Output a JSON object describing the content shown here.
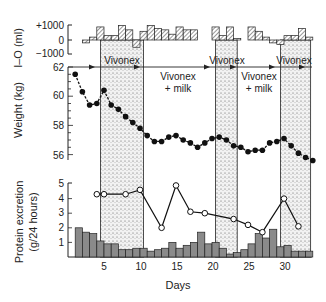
{
  "chart_data": [
    {
      "type": "bar",
      "panel": "intake-output",
      "ylabel": "I–O (ml)",
      "yticks": [
        "+1000",
        "0",
        "−1000"
      ],
      "ylim": [
        -1000,
        1000
      ],
      "x": [
        1,
        2,
        3,
        4,
        5,
        6,
        7,
        8,
        9,
        10,
        11,
        12,
        13,
        14,
        15,
        16,
        17,
        18,
        19,
        20,
        21,
        22,
        23,
        24,
        25,
        26,
        27,
        28,
        29,
        30,
        31,
        32,
        33
      ],
      "values": [
        0,
        -200,
        200,
        900,
        300,
        300,
        1000,
        700,
        -500,
        600,
        1000,
        800,
        700,
        400,
        900,
        700,
        700,
        0,
        0,
        900,
        300,
        900,
        100,
        0,
        900,
        600,
        200,
        -200,
        -300,
        300,
        300,
        800,
        200
      ]
    },
    {
      "type": "line",
      "panel": "weight",
      "ylabel": "Weight (kg)",
      "yticks": [
        62,
        60,
        58,
        56
      ],
      "ylim": [
        55.5,
        62.2
      ],
      "x": [
        1,
        2,
        3,
        4,
        5,
        6,
        7,
        8,
        9,
        10,
        11,
        12,
        13,
        14,
        15,
        16,
        17,
        18,
        19,
        20,
        21,
        22,
        23,
        24,
        25,
        26,
        27,
        28,
        29,
        30,
        31,
        32,
        33,
        34
      ],
      "values": [
        61.5,
        60.3,
        59.4,
        59.5,
        60.4,
        59.4,
        59.1,
        58.6,
        58.2,
        57.8,
        57.3,
        56.9,
        56.9,
        57.2,
        57.3,
        57.0,
        56.8,
        56.5,
        56.8,
        57.1,
        57.2,
        57.0,
        56.6,
        56.5,
        56.2,
        56.3,
        56.3,
        56.8,
        56.9,
        57.1,
        56.6,
        56.1,
        55.8,
        55.6
      ]
    },
    {
      "type": "line",
      "panel": "protein-excretion",
      "ylabel": "Protein excretion (g/24 hours)",
      "yticks": [
        5,
        4,
        3,
        2,
        1
      ],
      "ylim": [
        0,
        5
      ],
      "series": [
        {
          "name": "protein (open circles)",
          "x": [
            4,
            5,
            8,
            10,
            13,
            15,
            17,
            19,
            23,
            25,
            27,
            30,
            32
          ],
          "values": [
            4.3,
            4.3,
            4.3,
            4.6,
            2.0,
            4.9,
            3.1,
            3.0,
            2.6,
            2.2,
            1.7,
            4.0,
            2.1
          ]
        },
        {
          "name": "daily bars",
          "x": [
            2,
            3,
            4,
            5,
            6,
            7,
            8,
            9,
            10,
            11,
            12,
            13,
            14,
            15,
            16,
            17,
            18,
            19,
            20,
            21,
            22,
            23,
            24,
            25,
            26,
            27,
            28,
            29,
            30,
            31,
            32,
            33,
            34
          ],
          "values": [
            2.0,
            1.7,
            1.6,
            1.1,
            0.9,
            0.9,
            0.5,
            0.5,
            0.6,
            0.6,
            0.4,
            0.5,
            0.6,
            1.0,
            0.6,
            0.8,
            1.0,
            1.7,
            0.9,
            1.0,
            0.6,
            0.2,
            0.3,
            0.5,
            0.9,
            1.6,
            1.3,
            1.9,
            0.7,
            0.8,
            0.4,
            0.4,
            0.4
          ]
        }
      ]
    }
  ],
  "xaxis": {
    "label": "Days",
    "ticks": [
      5,
      10,
      15,
      20,
      25,
      30
    ]
  },
  "phases": [
    {
      "label": "Vivonex",
      "start": 4.5,
      "end": 10.5,
      "shaded": true
    },
    {
      "label": "Vivonex",
      "label2": "+ milk",
      "start": 10.5,
      "end": 20.5,
      "shaded": false
    },
    {
      "label": "Vivonex",
      "start": 20.5,
      "end": 23.5,
      "shaded": true
    },
    {
      "label": "Vivonex",
      "label2": "+ milk",
      "start": 23.5,
      "end": 29.5,
      "shaded": false
    },
    {
      "label": "Vivonex",
      "start": 29.5,
      "end": 33.7,
      "shaded": true
    }
  ],
  "labels": {
    "io_axis": "I–O (ml)",
    "io_plus": "+1000",
    "io_zero": "0",
    "io_minus": "−1000",
    "weight_axis": "Weight (kg)",
    "w62": "62",
    "w60": "60",
    "w58": "58",
    "w56": "56",
    "protein_axis1": "Protein excretion",
    "protein_axis2": "(g/24 hours)",
    "p5": "5",
    "p4": "4",
    "p3": "3",
    "p2": "2",
    "p1": "1",
    "x5": "5",
    "x10": "10",
    "x15": "15",
    "x20": "20",
    "x25": "25",
    "x30": "30",
    "days": "Days",
    "phase1": "Vivonex",
    "phase2a": "Vivonex",
    "phase2b": "+ milk",
    "phase3": "Vivonex",
    "phase4a": "Vivonex",
    "phase4b": "+ milk",
    "phase5": "Vivonex"
  }
}
